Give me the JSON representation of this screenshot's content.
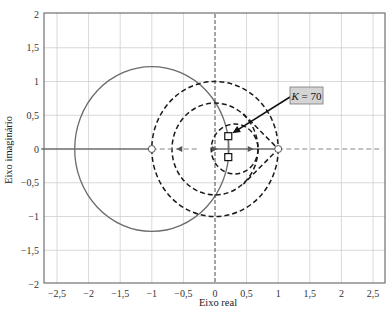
{
  "chart_data": {
    "type": "line",
    "title": "",
    "xlabel": "Eixo real",
    "ylabel": "Eixo imaginário",
    "xlim": [
      -2.75,
      2.65
    ],
    "ylim": [
      -2,
      2
    ],
    "grid": true,
    "x_ticks": [
      -2.5,
      -2,
      -1.5,
      -1,
      -0.5,
      0,
      0.5,
      1,
      1.5,
      2,
      2.5
    ],
    "x_tick_labels": [
      "−2,5",
      "−2",
      "−1,5",
      "−1",
      "−0,5",
      "0",
      "0,5",
      "1",
      "1,5",
      "2",
      "2,5"
    ],
    "y_ticks": [
      2,
      1.5,
      1,
      0.5,
      0,
      -0.5,
      -1,
      -1.5,
      -2
    ],
    "y_tick_labels": [
      "2",
      "1,5",
      "1",
      "0,5",
      "0",
      "−0,5",
      "−1",
      "−1,5",
      "−2"
    ],
    "series": [
      {
        "name": "root-locus-circle",
        "style": "solid-gray",
        "shape": "circle",
        "center": [
          -1,
          0
        ],
        "radius": 1.22
      },
      {
        "name": "root-locus-real-axis",
        "style": "solid-gray",
        "points": [
          [
            -2.75,
            0
          ],
          [
            -1,
            0
          ]
        ]
      },
      {
        "name": "root-locus-real-axis-right",
        "style": "solid-gray",
        "points": [
          [
            -0.05,
            0
          ],
          [
            1,
            0
          ]
        ]
      },
      {
        "name": "root-locus-vertical-segment",
        "style": "solid-gray",
        "points": [
          [
            0.21,
            0.19
          ],
          [
            0.21,
            -0.12
          ]
        ]
      },
      {
        "name": "constant-gain-circle-large",
        "style": "dashed-black",
        "shape": "circle",
        "center": [
          0,
          0
        ],
        "radius": 1.0
      },
      {
        "name": "constant-gain-circle-medium",
        "style": "dashed-black",
        "shape": "circle",
        "center": [
          0,
          0
        ],
        "radius": 0.68
      },
      {
        "name": "constant-gain-circle-small",
        "style": "dashed-black",
        "shape": "circle",
        "center": [
          0.31,
          0
        ],
        "radius": 0.37
      },
      {
        "name": "dashed-lobe-to-one",
        "style": "dashed-black",
        "points": [
          [
            0.45,
            0.52
          ],
          [
            1,
            0
          ],
          [
            0.45,
            -0.52
          ]
        ]
      },
      {
        "name": "dashed-axis-right",
        "style": "dashed-gray",
        "points": [
          [
            1,
            0
          ],
          [
            2.65,
            0
          ]
        ]
      },
      {
        "name": "dashed-axis-between",
        "style": "dashed-gray",
        "points": [
          [
            -1,
            0
          ],
          [
            -0.28,
            0
          ]
        ]
      },
      {
        "name": "dashed-imag-axis",
        "style": "dashed-black-thin",
        "points": [
          [
            0,
            2
          ],
          [
            0,
            -2
          ]
        ]
      }
    ],
    "markers": [
      {
        "name": "zero-marker",
        "shape": "open-circle",
        "x": -1,
        "y": 0
      },
      {
        "name": "pole-marker",
        "shape": "open-circle",
        "x": 1,
        "y": 0
      },
      {
        "name": "closed-loop-pole-upper",
        "shape": "square",
        "x": 0.21,
        "y": 0.19
      },
      {
        "name": "closed-loop-pole-lower",
        "shape": "square",
        "x": 0.21,
        "y": -0.12
      }
    ],
    "annotations": [
      {
        "text": "K = 70",
        "box_at": [
          1.15,
          0.8
        ],
        "arrow_to": [
          0.21,
          0.19
        ]
      }
    ]
  },
  "labels": {
    "xlabel": "Eixo real",
    "ylabel": "Eixo imaginário",
    "annotation_k": "K",
    "annotation_value": " = 70"
  },
  "colors": {
    "grid": "#cfcfcf",
    "axis_frame": "#555555",
    "locus_gray": "#6b6b6b",
    "dashed_black": "#1a1a1a",
    "annotation_fill": "#d4d4d4",
    "annotation_border": "#777777"
  }
}
